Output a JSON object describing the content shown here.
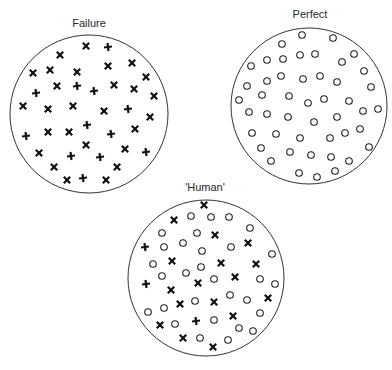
{
  "figure": {
    "panels": [
      {
        "id": "failure",
        "title": "Failure",
        "title_pos": [
          89,
          25
        ],
        "circle": {
          "cx": 89,
          "cy": 114,
          "r": 79
        },
        "markers": [
          {
            "x": 86,
            "y": 46,
            "t": "x"
          },
          {
            "x": 108,
            "y": 47,
            "t": "+"
          },
          {
            "x": 60,
            "y": 55,
            "t": "x"
          },
          {
            "x": 33,
            "y": 73,
            "t": "x"
          },
          {
            "x": 50,
            "y": 70,
            "t": "x"
          },
          {
            "x": 77,
            "y": 72,
            "t": "x"
          },
          {
            "x": 108,
            "y": 66,
            "t": "x"
          },
          {
            "x": 132,
            "y": 63,
            "t": "x"
          },
          {
            "x": 146,
            "y": 77,
            "t": "x"
          },
          {
            "x": 36,
            "y": 93,
            "t": "+"
          },
          {
            "x": 57,
            "y": 86,
            "t": "x"
          },
          {
            "x": 77,
            "y": 86,
            "t": "+"
          },
          {
            "x": 94,
            "y": 91,
            "t": "+"
          },
          {
            "x": 114,
            "y": 85,
            "t": "x"
          },
          {
            "x": 134,
            "y": 89,
            "t": "x"
          },
          {
            "x": 154,
            "y": 96,
            "t": "x"
          },
          {
            "x": 23,
            "y": 106,
            "t": "x"
          },
          {
            "x": 48,
            "y": 109,
            "t": "x"
          },
          {
            "x": 73,
            "y": 106,
            "t": "x"
          },
          {
            "x": 104,
            "y": 111,
            "t": "x"
          },
          {
            "x": 128,
            "y": 109,
            "t": "+"
          },
          {
            "x": 150,
            "y": 117,
            "t": "x"
          },
          {
            "x": 26,
            "y": 136,
            "t": "+"
          },
          {
            "x": 48,
            "y": 132,
            "t": "x"
          },
          {
            "x": 69,
            "y": 132,
            "t": "x"
          },
          {
            "x": 87,
            "y": 125,
            "t": "+"
          },
          {
            "x": 111,
            "y": 134,
            "t": "+"
          },
          {
            "x": 135,
            "y": 129,
            "t": "x"
          },
          {
            "x": 39,
            "y": 153,
            "t": "x"
          },
          {
            "x": 86,
            "y": 145,
            "t": "x"
          },
          {
            "x": 71,
            "y": 156,
            "t": "+"
          },
          {
            "x": 100,
            "y": 157,
            "t": "+"
          },
          {
            "x": 125,
            "y": 149,
            "t": "x"
          },
          {
            "x": 146,
            "y": 152,
            "t": "+"
          },
          {
            "x": 54,
            "y": 167,
            "t": "x"
          },
          {
            "x": 117,
            "y": 167,
            "t": "x"
          },
          {
            "x": 67,
            "y": 180,
            "t": "x"
          },
          {
            "x": 83,
            "y": 178,
            "t": "+"
          },
          {
            "x": 106,
            "y": 180,
            "t": "x"
          }
        ]
      },
      {
        "id": "perfect",
        "title": "Perfect",
        "title_pos": [
          310,
          16
        ],
        "circle": {
          "cx": 309,
          "cy": 106,
          "r": 78
        },
        "markers": [
          {
            "x": 302,
            "y": 35,
            "t": "o"
          },
          {
            "x": 333,
            "y": 38,
            "t": "o"
          },
          {
            "x": 282,
            "y": 44,
            "t": "o"
          },
          {
            "x": 354,
            "y": 54,
            "t": "o"
          },
          {
            "x": 300,
            "y": 55,
            "t": "o"
          },
          {
            "x": 315,
            "y": 54,
            "t": "o"
          },
          {
            "x": 267,
            "y": 60,
            "t": "o"
          },
          {
            "x": 283,
            "y": 59,
            "t": "o"
          },
          {
            "x": 342,
            "y": 62,
            "t": "o"
          },
          {
            "x": 251,
            "y": 66,
            "t": "o"
          },
          {
            "x": 364,
            "y": 71,
            "t": "o"
          },
          {
            "x": 281,
            "y": 76,
            "t": "o"
          },
          {
            "x": 303,
            "y": 79,
            "t": "o"
          },
          {
            "x": 320,
            "y": 76,
            "t": "o"
          },
          {
            "x": 337,
            "y": 82,
            "t": "o"
          },
          {
            "x": 267,
            "y": 81,
            "t": "o"
          },
          {
            "x": 247,
            "y": 86,
            "t": "o"
          },
          {
            "x": 371,
            "y": 87,
            "t": "o"
          },
          {
            "x": 262,
            "y": 95,
            "t": "o"
          },
          {
            "x": 289,
            "y": 96,
            "t": "o"
          },
          {
            "x": 239,
            "y": 100,
            "t": "o"
          },
          {
            "x": 308,
            "y": 103,
            "t": "o"
          },
          {
            "x": 324,
            "y": 99,
            "t": "o"
          },
          {
            "x": 349,
            "y": 101,
            "t": "o"
          },
          {
            "x": 378,
            "y": 109,
            "t": "o"
          },
          {
            "x": 249,
            "y": 112,
            "t": "o"
          },
          {
            "x": 267,
            "y": 114,
            "t": "o"
          },
          {
            "x": 288,
            "y": 117,
            "t": "o"
          },
          {
            "x": 363,
            "y": 111,
            "t": "o"
          },
          {
            "x": 314,
            "y": 122,
            "t": "o"
          },
          {
            "x": 337,
            "y": 117,
            "t": "o"
          },
          {
            "x": 252,
            "y": 133,
            "t": "o"
          },
          {
            "x": 276,
            "y": 134,
            "t": "o"
          },
          {
            "x": 300,
            "y": 138,
            "t": "o"
          },
          {
            "x": 330,
            "y": 138,
            "t": "o"
          },
          {
            "x": 345,
            "y": 133,
            "t": "o"
          },
          {
            "x": 360,
            "y": 129,
            "t": "o"
          },
          {
            "x": 261,
            "y": 148,
            "t": "o"
          },
          {
            "x": 290,
            "y": 152,
            "t": "o"
          },
          {
            "x": 311,
            "y": 155,
            "t": "o"
          },
          {
            "x": 331,
            "y": 157,
            "t": "o"
          },
          {
            "x": 349,
            "y": 161,
            "t": "o"
          },
          {
            "x": 369,
            "y": 147,
            "t": "o"
          },
          {
            "x": 271,
            "y": 161,
            "t": "o"
          },
          {
            "x": 299,
            "y": 173,
            "t": "o"
          },
          {
            "x": 317,
            "y": 177,
            "t": "o"
          },
          {
            "x": 335,
            "y": 171,
            "t": "o"
          }
        ]
      },
      {
        "id": "human",
        "title": "'Human'",
        "title_pos": [
          205,
          189
        ],
        "circle": {
          "cx": 206,
          "cy": 278,
          "r": 78
        },
        "markers": [
          {
            "x": 204,
            "y": 205,
            "t": "x"
          },
          {
            "x": 174,
            "y": 220,
            "t": "x"
          },
          {
            "x": 215,
            "y": 235,
            "t": "x"
          },
          {
            "x": 145,
            "y": 247,
            "t": "+"
          },
          {
            "x": 248,
            "y": 243,
            "t": "x"
          },
          {
            "x": 172,
            "y": 261,
            "t": "x"
          },
          {
            "x": 221,
            "y": 263,
            "t": "x"
          },
          {
            "x": 256,
            "y": 264,
            "t": "x"
          },
          {
            "x": 146,
            "y": 284,
            "t": "+"
          },
          {
            "x": 235,
            "y": 277,
            "t": "x"
          },
          {
            "x": 171,
            "y": 290,
            "t": "x"
          },
          {
            "x": 198,
            "y": 283,
            "t": "x"
          },
          {
            "x": 180,
            "y": 304,
            "t": "x"
          },
          {
            "x": 214,
            "y": 302,
            "t": "x"
          },
          {
            "x": 268,
            "y": 298,
            "t": "x"
          },
          {
            "x": 160,
            "y": 325,
            "t": "x"
          },
          {
            "x": 196,
            "y": 321,
            "t": "+"
          },
          {
            "x": 233,
            "y": 316,
            "t": "x"
          },
          {
            "x": 183,
            "y": 338,
            "t": "x"
          },
          {
            "x": 213,
            "y": 347,
            "t": "x"
          },
          {
            "x": 191,
            "y": 216,
            "t": "o"
          },
          {
            "x": 211,
            "y": 217,
            "t": "o"
          },
          {
            "x": 229,
            "y": 217,
            "t": "o"
          },
          {
            "x": 250,
            "y": 228,
            "t": "o"
          },
          {
            "x": 162,
            "y": 233,
            "t": "o"
          },
          {
            "x": 197,
            "y": 233,
            "t": "o"
          },
          {
            "x": 164,
            "y": 247,
            "t": "o"
          },
          {
            "x": 183,
            "y": 243,
            "t": "o"
          },
          {
            "x": 202,
            "y": 251,
            "t": "o"
          },
          {
            "x": 231,
            "y": 247,
            "t": "o"
          },
          {
            "x": 272,
            "y": 254,
            "t": "o"
          },
          {
            "x": 153,
            "y": 264,
            "t": "o"
          },
          {
            "x": 201,
            "y": 267,
            "t": "o"
          },
          {
            "x": 162,
            "y": 276,
            "t": "o"
          },
          {
            "x": 186,
            "y": 273,
            "t": "o"
          },
          {
            "x": 214,
            "y": 279,
            "t": "o"
          },
          {
            "x": 260,
            "y": 279,
            "t": "o"
          },
          {
            "x": 275,
            "y": 284,
            "t": "o"
          },
          {
            "x": 230,
            "y": 295,
            "t": "o"
          },
          {
            "x": 247,
            "y": 300,
            "t": "o"
          },
          {
            "x": 195,
            "y": 301,
            "t": "o"
          },
          {
            "x": 164,
            "y": 308,
            "t": "o"
          },
          {
            "x": 148,
            "y": 312,
            "t": "o"
          },
          {
            "x": 214,
            "y": 320,
            "t": "o"
          },
          {
            "x": 260,
            "y": 313,
            "t": "o"
          },
          {
            "x": 175,
            "y": 324,
            "t": "o"
          },
          {
            "x": 239,
            "y": 328,
            "t": "o"
          },
          {
            "x": 253,
            "y": 331,
            "t": "o"
          },
          {
            "x": 200,
            "y": 338,
            "t": "o"
          },
          {
            "x": 228,
            "y": 340,
            "t": "o"
          }
        ]
      }
    ],
    "legend": {
      "x": "cross (x) marker",
      "+": "cross (+) marker",
      "o": "circle marker"
    }
  }
}
